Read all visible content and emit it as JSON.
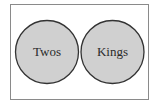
{
  "diagram": {
    "type": "venn",
    "relationship": "disjoint",
    "colors": {
      "frame": "#8a8a8a",
      "circle_fill": "#d0d0d0",
      "circle_stroke": "#333333",
      "text": "#2a2a2a"
    },
    "sets": [
      {
        "label": "Twos"
      },
      {
        "label": "Kings"
      }
    ]
  }
}
